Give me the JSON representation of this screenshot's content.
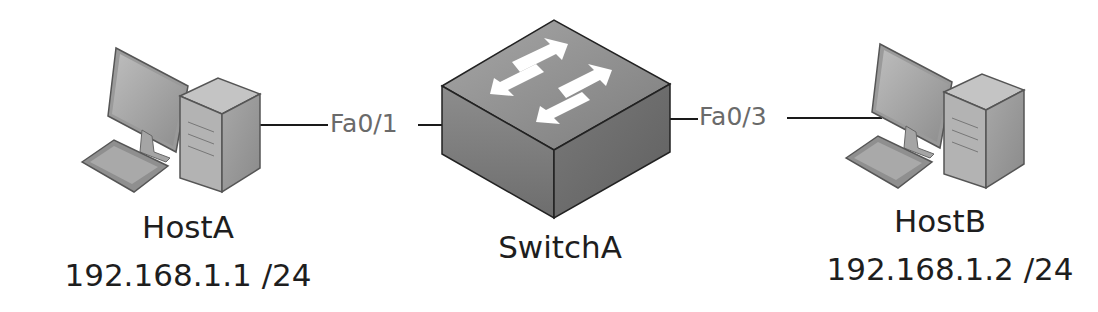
{
  "diagram": {
    "type": "network-topology",
    "nodes": [
      {
        "id": "hostA",
        "kind": "pc",
        "name": "HostA",
        "ip": "192.168.1.1 /24"
      },
      {
        "id": "switchA",
        "kind": "switch",
        "name": "SwitchA"
      },
      {
        "id": "hostB",
        "kind": "pc",
        "name": "HostB",
        "ip": "192.168.1.2 /24"
      }
    ],
    "links": [
      {
        "from": "hostA",
        "to": "switchA",
        "port": "Fa0/1"
      },
      {
        "from": "switchA",
        "to": "hostB",
        "port": "Fa0/3"
      }
    ]
  },
  "colors": {
    "line": "#1a1a1a",
    "port_text": "#6a6a6a",
    "label_text": "#1e1e1e",
    "device_gray": "#9a9a9a"
  }
}
